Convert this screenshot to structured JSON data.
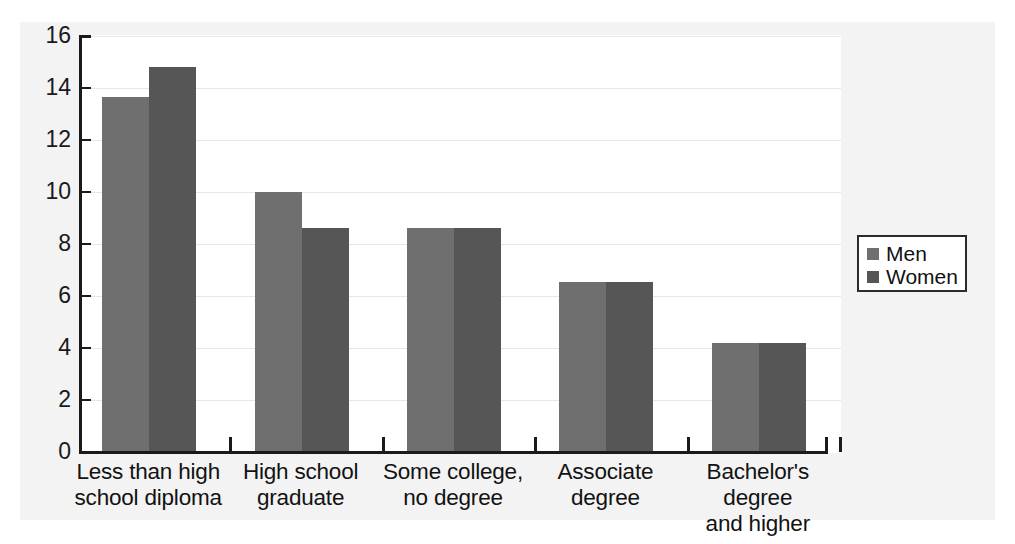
{
  "chart_data": {
    "type": "bar",
    "title": "",
    "xlabel": "",
    "ylabel": "",
    "ylim": [
      0,
      16
    ],
    "ytick_step": 2,
    "yticks": [
      "16",
      "14",
      "12",
      "10",
      "8",
      "6",
      "4",
      "2",
      "0"
    ],
    "grid": true,
    "legend_position": "right",
    "categories": [
      "Less than high school diploma",
      "High school graduate",
      "Some college, no degree",
      "Associate degree",
      "Bachelor's degree and higher"
    ],
    "category_lines": [
      [
        "Less than high",
        "school diploma"
      ],
      [
        "High school",
        "graduate"
      ],
      [
        "Some college,",
        "no degree"
      ],
      [
        "Associate",
        "degree"
      ],
      [
        "Bachelor's degree",
        "and higher"
      ]
    ],
    "series": [
      {
        "name": "Men",
        "color": "#6f6f6f",
        "values": [
          13.65,
          10.0,
          8.6,
          6.55,
          4.2
        ]
      },
      {
        "name": "Women",
        "color": "#565656",
        "values": [
          14.8,
          8.6,
          8.6,
          6.55,
          4.2
        ]
      }
    ]
  },
  "legend": {
    "entries": [
      {
        "label": "Men",
        "color": "#6f6f6f"
      },
      {
        "label": "Women",
        "color": "#565656"
      }
    ]
  },
  "colors": {
    "panel_background": "#f3f3f3",
    "plot_background": "#ffffff",
    "axis": "#1a1a1a",
    "gridline": "#e7e7e7",
    "men_bar": "#6f6f6f",
    "women_bar": "#565656"
  }
}
